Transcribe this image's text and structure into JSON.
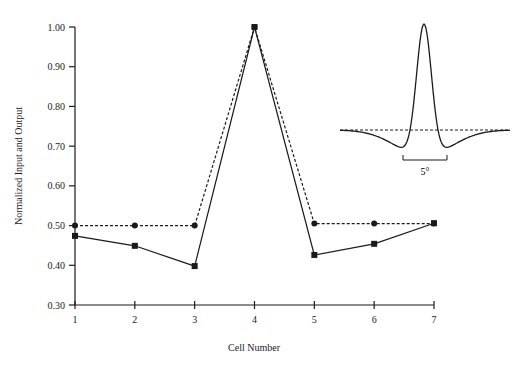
{
  "chart_data": {
    "type": "line",
    "title": "",
    "xlabel": "Cell Number",
    "ylabel": "Normalized Input and Output",
    "x": [
      1,
      2,
      3,
      4,
      5,
      6,
      7
    ],
    "xticks": [
      "1",
      "2",
      "3",
      "4",
      "5",
      "6",
      "7"
    ],
    "yticks": [
      "0.30",
      "0.40",
      "0.50",
      "0.60",
      "0.70",
      "0.80",
      "0.90",
      "1.00"
    ],
    "ylim": [
      0.3,
      1.0
    ],
    "xlim": [
      1,
      7
    ],
    "grid": false,
    "legend": null,
    "series": [
      {
        "name": "Input",
        "style": "dashed",
        "marker": "circle",
        "values": [
          0.5,
          0.5,
          0.5,
          1.0,
          0.505,
          0.505,
          0.505
        ]
      },
      {
        "name": "Output",
        "style": "solid",
        "marker": "square",
        "values": [
          0.474,
          0.449,
          0.398,
          1.0,
          0.426,
          0.454,
          0.506
        ]
      }
    ],
    "inset": {
      "description": "Difference-of-Gaussians receptive field profile (solid) with dashed zero baseline",
      "scale_bar_label": "5°"
    }
  },
  "colors": {
    "line": "#1a1a1a",
    "background": "#ffffff"
  }
}
